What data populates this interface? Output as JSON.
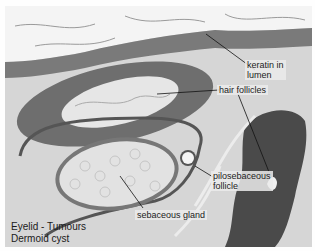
{
  "image": {
    "subject": "histology micrograph",
    "stain_appearance": "grayscale"
  },
  "annotations": [
    {
      "id": "keratin",
      "text_line1": "keratin in",
      "text_line2": "lumen"
    },
    {
      "id": "hair",
      "text": "hair follicles"
    },
    {
      "id": "pilo",
      "text_line1": "pilosebaceous",
      "text_line2": "follicle"
    },
    {
      "id": "seb",
      "text": "sebaceous gland"
    }
  ],
  "caption": {
    "line1": "Eyelid - Tumours",
    "line2": "Dermoid cyst"
  }
}
